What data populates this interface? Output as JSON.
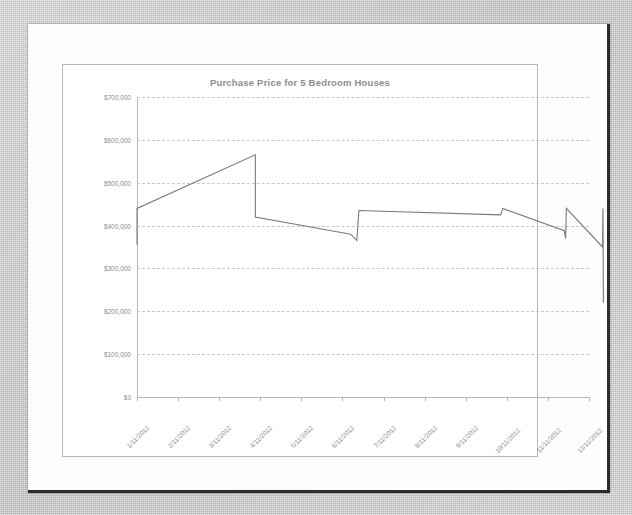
{
  "document": {
    "kind": "scanned-page",
    "page_background": "#fdfdfd",
    "scan_background": "#c9c9c9"
  },
  "chart_data": {
    "type": "line",
    "title": "Purchase Price for 5 Bedroom Houses",
    "xlabel": "",
    "ylabel": "",
    "grid": true,
    "legend": "none",
    "line_color": "#7a7a7a",
    "gridline_color": "#c3c9d4",
    "axis_color": "#b6b6b6",
    "text_color": "#8d8d8d",
    "ylim": [
      0,
      700000
    ],
    "ytick_values": [
      0,
      100000,
      200000,
      300000,
      400000,
      500000,
      600000,
      700000
    ],
    "ytick_labels": [
      "$0",
      "$100,000",
      "$200,000",
      "$300,000",
      "$400,000",
      "$500,000",
      "$600,000",
      "$700,000"
    ],
    "categories": [
      "1/11/2012",
      "2/11/2012",
      "3/11/2012",
      "4/11/2012",
      "5/11/2012",
      "6/11/2012",
      "7/11/2012",
      "8/11/2012",
      "9/11/2012",
      "10/11/2012",
      "11/11/2012",
      "12/11/2012"
    ],
    "series": [
      {
        "name": "Purchase Price",
        "points": [
          {
            "x": 0.0,
            "y": 355000
          },
          {
            "x": 0.0,
            "y": 440000
          },
          {
            "x": 2.88,
            "y": 565000
          },
          {
            "x": 2.88,
            "y": 420000
          },
          {
            "x": 5.2,
            "y": 380000
          },
          {
            "x": 5.35,
            "y": 365000
          },
          {
            "x": 5.4,
            "y": 435000
          },
          {
            "x": 8.85,
            "y": 425000
          },
          {
            "x": 8.9,
            "y": 440000
          },
          {
            "x": 10.4,
            "y": 388000
          },
          {
            "x": 10.43,
            "y": 370000
          },
          {
            "x": 10.45,
            "y": 440000
          },
          {
            "x": 11.33,
            "y": 350000
          },
          {
            "x": 11.34,
            "y": 440000
          },
          {
            "x": 11.35,
            "y": 220000
          }
        ]
      }
    ]
  }
}
